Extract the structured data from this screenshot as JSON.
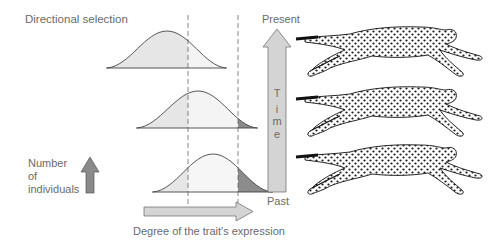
{
  "title": "Directional selection",
  "y_axis_label": [
    "Number",
    "of",
    "individuals"
  ],
  "x_axis_label": "Degree of the trait's expression",
  "time_axis": {
    "top_label": "Present",
    "bottom_label": "Past",
    "arrow_letters": [
      "T",
      "i",
      "m",
      "e"
    ]
  },
  "distributions": [
    {
      "position": "top",
      "era": "present",
      "description": "Distribution shifted left relative to later selection; right of first dashed line lighter"
    },
    {
      "position": "middle",
      "era": "intermediate",
      "description": "Distribution shifted right; small dark tail beyond second dashed line"
    },
    {
      "position": "bottom",
      "era": "past",
      "description": "Distribution with dark-shaded right tail beyond second dashed line (selected individuals)"
    }
  ],
  "colors": {
    "text": "#6a6a6a",
    "curve_fill_light": "#e6e6e6",
    "curve_fill_lighter": "#f4f4f4",
    "tail_dark": "#8c8c8c",
    "arrow_fill": "#cfcfcf",
    "arrow_dark": "#8a8a8a",
    "line": "#444444"
  },
  "illustrations": [
    {
      "name": "cheetah-running-top"
    },
    {
      "name": "cheetah-running-middle"
    },
    {
      "name": "cheetah-running-bottom"
    }
  ]
}
